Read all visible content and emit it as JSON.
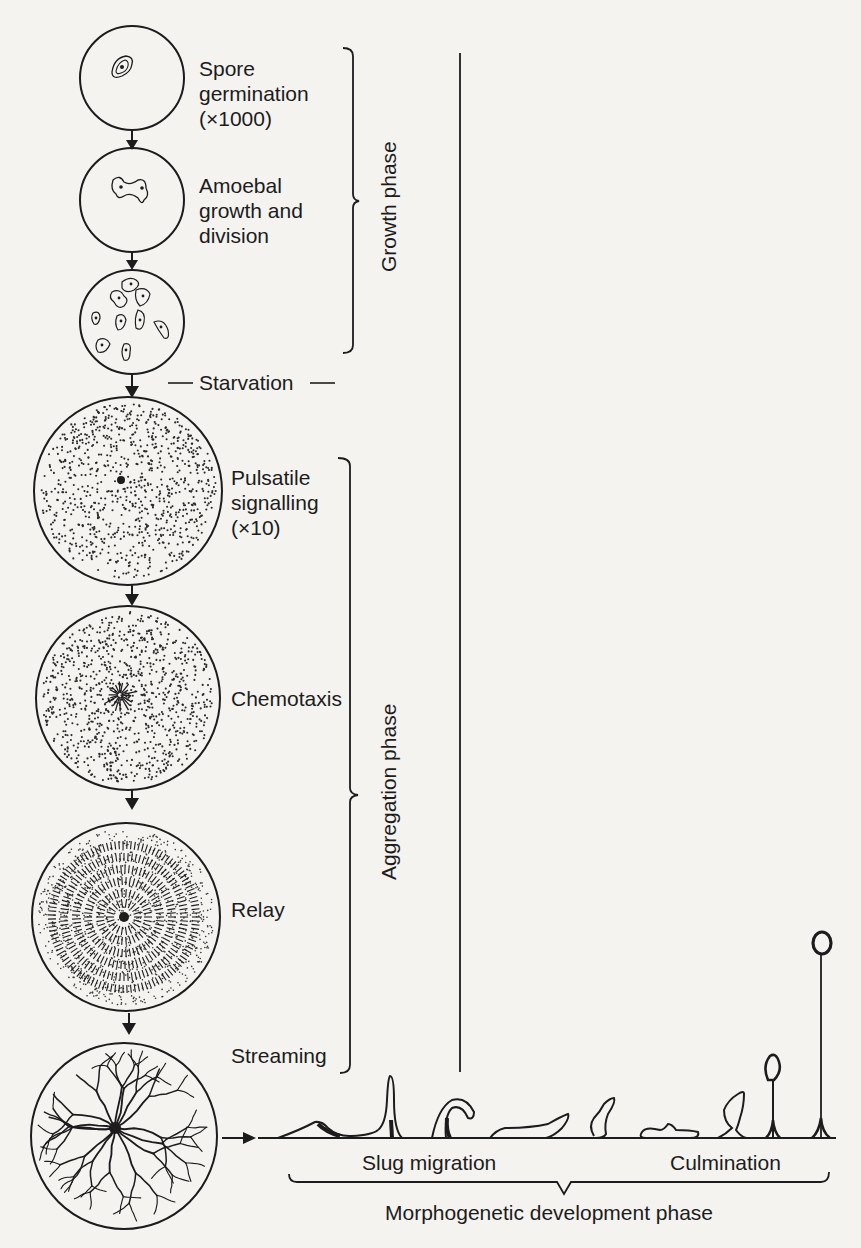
{
  "diagram": {
    "stages": [
      {
        "id": "spore-germination",
        "lines": [
          "Spore",
          "germination",
          "(×1000)"
        ]
      },
      {
        "id": "amoebal-growth",
        "lines": [
          "Amoebal",
          "growth and",
          "division"
        ]
      },
      {
        "id": "vegetative-amoebae",
        "lines": []
      },
      {
        "id": "pulsatile-signalling",
        "lines": [
          "Pulsatile",
          "signalling",
          "(×10)"
        ]
      },
      {
        "id": "chemotaxis",
        "lines": [
          "Chemotaxis"
        ]
      },
      {
        "id": "relay",
        "lines": [
          "Relay"
        ]
      },
      {
        "id": "streaming",
        "lines": [
          "Streaming"
        ]
      }
    ],
    "transition_label": "Starvation",
    "phases": {
      "growth": "Growth phase",
      "aggregation": "Aggregation phase",
      "morphogenetic": "Morphogenetic development phase"
    },
    "morph_labels": {
      "slug_migration": "Slug migration",
      "culmination": "Culmination"
    },
    "colors": {
      "ink": "#1c1c1c",
      "paper": "#f4f3f0"
    }
  }
}
